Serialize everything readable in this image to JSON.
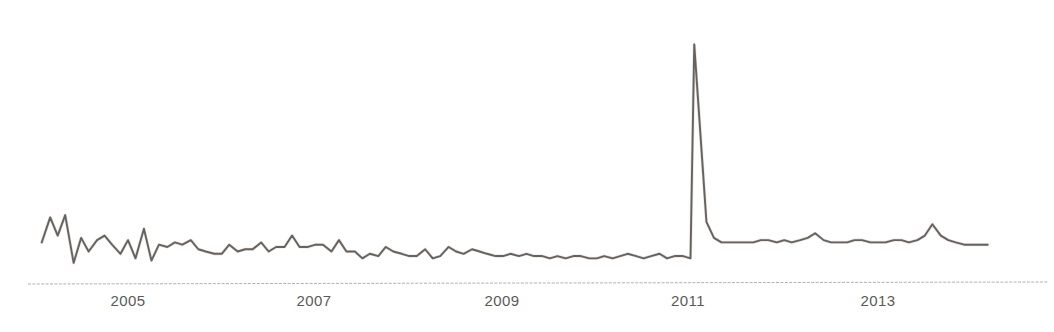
{
  "chart_data": {
    "type": "line",
    "title": "",
    "subtitle": "",
    "xlabel": "",
    "ylabel": "",
    "grid": false,
    "legend": null,
    "axis": {
      "x_tick_labels": [
        "2005",
        "2007",
        "2009",
        "2011",
        "2013"
      ],
      "x_tick_pixels": [
        128,
        314,
        502,
        688,
        878
      ],
      "x_range_label": "2004-2014",
      "y_axis_visible": false,
      "y_tick_labels": [],
      "baseline_visible": true
    },
    "series": [
      {
        "name": "series-1",
        "color": "#5a5450",
        "x": [
          2004.08,
          2004.17,
          2004.25,
          2004.33,
          2004.42,
          2004.5,
          2004.58,
          2004.67,
          2004.75,
          2004.83,
          2004.92,
          2005.0,
          2005.08,
          2005.17,
          2005.25,
          2005.33,
          2005.42,
          2005.5,
          2005.58,
          2005.67,
          2005.75,
          2005.83,
          2005.92,
          2006.0,
          2006.08,
          2006.17,
          2006.25,
          2006.33,
          2006.42,
          2006.5,
          2006.58,
          2006.67,
          2006.75,
          2006.83,
          2006.92,
          2007.0,
          2007.08,
          2007.17,
          2007.25,
          2007.33,
          2007.42,
          2007.5,
          2007.58,
          2007.67,
          2007.75,
          2007.83,
          2007.92,
          2008.0,
          2008.08,
          2008.17,
          2008.25,
          2008.33,
          2008.42,
          2008.5,
          2008.58,
          2008.67,
          2008.75,
          2008.83,
          2008.92,
          2009.0,
          2009.08,
          2009.17,
          2009.25,
          2009.33,
          2009.42,
          2009.5,
          2009.58,
          2009.67,
          2009.75,
          2009.83,
          2009.92,
          2010.0,
          2010.08,
          2010.17,
          2010.25,
          2010.33,
          2010.42,
          2010.5,
          2010.58,
          2010.67,
          2010.75,
          2010.83,
          2010.92,
          2011.0,
          2011.04,
          2011.17,
          2011.25,
          2011.33,
          2011.42,
          2011.5,
          2011.58,
          2011.67,
          2011.75,
          2011.83,
          2011.92,
          2012.0,
          2012.08,
          2012.17,
          2012.25,
          2012.33,
          2012.42,
          2012.5,
          2012.58,
          2012.67,
          2012.75,
          2012.83,
          2012.92,
          2013.0,
          2013.08,
          2013.17,
          2013.25,
          2013.33,
          2013.42,
          2013.5,
          2013.58,
          2013.67,
          2013.75,
          2013.83,
          2013.92,
          2014.0,
          2014.08,
          2014.17
        ],
        "values": [
          13,
          24,
          16,
          25,
          4,
          15,
          9,
          14,
          16,
          12,
          8,
          14,
          6,
          19,
          5,
          12,
          11,
          13,
          12,
          14,
          10,
          9,
          8,
          8,
          12,
          9,
          10,
          10,
          13,
          9,
          11,
          11,
          16,
          11,
          11,
          12,
          12,
          9,
          14,
          9,
          9,
          6,
          8,
          7,
          11,
          9,
          8,
          7,
          7,
          10,
          6,
          7,
          11,
          9,
          8,
          10,
          9,
          8,
          7,
          7,
          8,
          7,
          8,
          7,
          7,
          6,
          7,
          6,
          7,
          7,
          6,
          6,
          7,
          6,
          7,
          8,
          7,
          6,
          7,
          8,
          6,
          7,
          7,
          6,
          100,
          22,
          15,
          13,
          13,
          13,
          13,
          13,
          14,
          14,
          13,
          14,
          13,
          14,
          15,
          17,
          14,
          13,
          13,
          13,
          14,
          14,
          13,
          13,
          13,
          14,
          14,
          13,
          14,
          16,
          21,
          16,
          14,
          13,
          12,
          12,
          12,
          12
        ]
      }
    ],
    "annotations": [
      {
        "label": "spike-peak",
        "x": 2011.04,
        "value": 100,
        "description": "sharp narrow peak near 2011"
      }
    ],
    "ylim": [
      0,
      105
    ],
    "xlim": [
      2004.0,
      2014.2
    ]
  },
  "figure": {
    "background_color": "#ffffff",
    "line_color": "#5a5450",
    "baseline_color": "#a9a39c",
    "tick_label_color": "#5c5a58",
    "line_width": 1.8
  }
}
